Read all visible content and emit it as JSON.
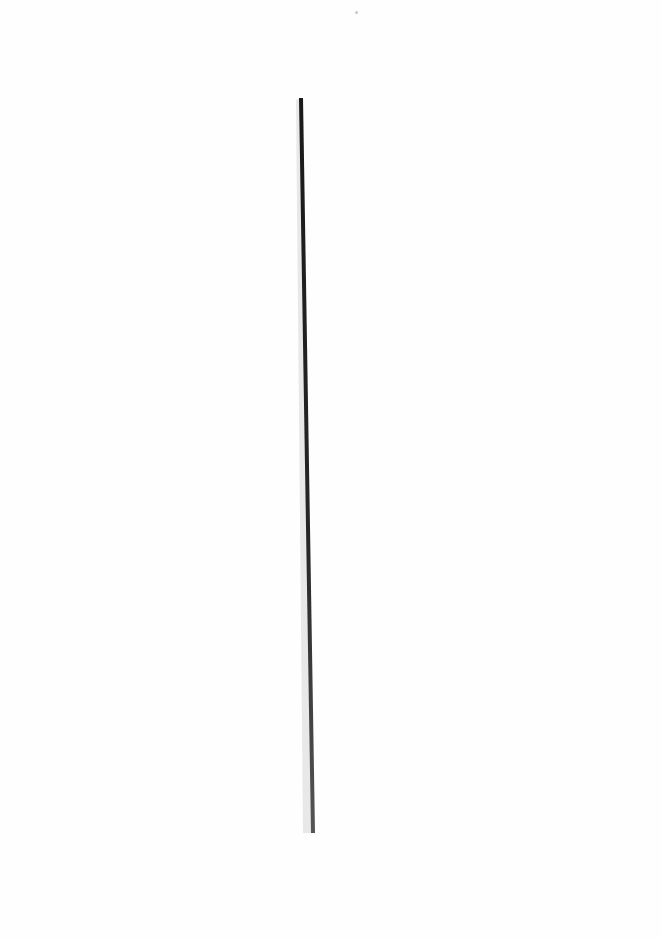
{
  "document": {
    "type": "scanned-blank-page",
    "text": "",
    "rule": {
      "orientation": "vertical",
      "start": [
        300,
        98
      ],
      "end": [
        313,
        833
      ],
      "color": "#222222",
      "shadow_color": "#d4d4d4"
    }
  }
}
